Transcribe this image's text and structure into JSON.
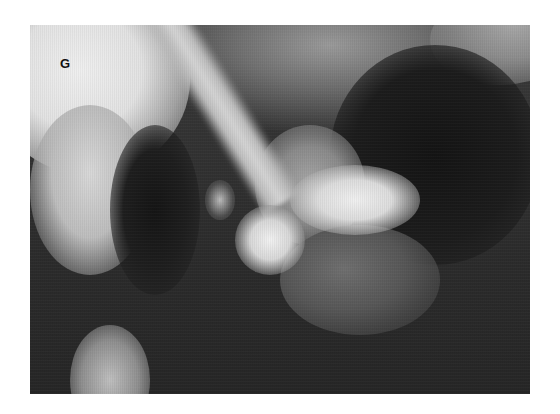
{
  "figure": {
    "type": "radiograph",
    "panel_label": "G",
    "colors": {
      "page_background": "#ffffff",
      "film_dark": "#1c1c1c",
      "film_mid": "#6f6f6f",
      "film_bright": "#efefef",
      "label_color": "#111111"
    }
  }
}
